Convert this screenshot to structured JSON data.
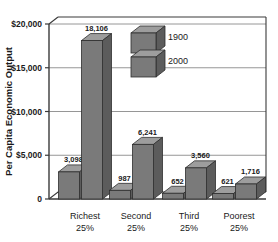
{
  "chart_data": {
    "type": "bar",
    "title": "",
    "subtitle": "",
    "xlabel": "",
    "ylabel": "Per Capita Economic Output",
    "ylim": [
      0,
      20000
    ],
    "ytick_values": [
      20000,
      15000,
      10000,
      5000,
      0
    ],
    "ytick_labels": [
      "$20,000",
      "$15,000",
      "$10,000",
      "$5,000",
      "0"
    ],
    "grid": true,
    "legend_position": "inside-top-center",
    "three_d": true,
    "categories": [
      "Richest 25%",
      "Second 25%",
      "Third 25%",
      "Poorest 25%"
    ],
    "category_lines": [
      [
        "Richest",
        "25%"
      ],
      [
        "Second",
        "25%"
      ],
      [
        "Third",
        "25%"
      ],
      [
        "Poorest",
        "25%"
      ]
    ],
    "series": [
      {
        "name": "1900",
        "values": [
          3098,
          987,
          652,
          621
        ],
        "labels": [
          "3,098",
          "987",
          "652",
          "621"
        ],
        "color": "#7a7a7a"
      },
      {
        "name": "2000",
        "values": [
          18106,
          6241,
          3560,
          1716
        ],
        "labels": [
          "18,106",
          "6,241",
          "3,560",
          "1,716"
        ],
        "color": "#7a7a7a"
      }
    ]
  },
  "legend": {
    "items": [
      {
        "label": "1900",
        "swatch": "cube-3d-gray"
      },
      {
        "label": "2000",
        "swatch": "cube-3d-gray"
      }
    ]
  },
  "colors": {
    "bar_front": "#7a7a7a",
    "bar_top": "#9d9d9d",
    "bar_side": "#5c5c5c",
    "bar_outline": "#2e2e2e",
    "grid": "#8a8a8a",
    "axis": "#3a3a3a",
    "text": "#1a1a1a",
    "background": "#ffffff"
  }
}
